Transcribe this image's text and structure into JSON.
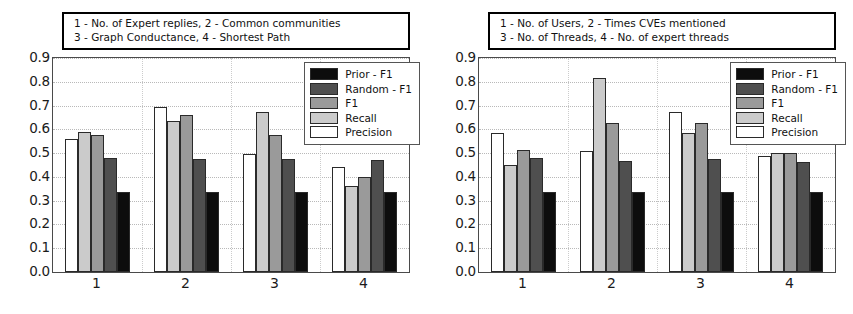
{
  "chart_data": [
    {
      "type": "bar",
      "panel": "left",
      "title": "1 - No. of Expert replies, 2 - Common communities\n3 - Graph Conductance, 4 - Shortest Path",
      "title_lines": [
        "1 - No. of Expert replies, 2 - Common communities",
        "3 - Graph Conductance, 4 - Shortest Path"
      ],
      "categories": [
        "1",
        "2",
        "3",
        "4"
      ],
      "xlabel": "",
      "ylabel": "",
      "ylim": [
        0.0,
        0.9
      ],
      "yticks": [
        "0.0",
        "0.1",
        "0.2",
        "0.3",
        "0.4",
        "0.5",
        "0.6",
        "0.7",
        "0.8",
        "0.9"
      ],
      "grid": true,
      "legend_position": "upper right",
      "series": [
        {
          "name": "Precision",
          "color": "#ffffff",
          "values": [
            0.56,
            0.695,
            0.495,
            0.44
          ]
        },
        {
          "name": "Recall",
          "color": "#cbcbcb",
          "values": [
            0.59,
            0.635,
            0.675,
            0.36
          ]
        },
        {
          "name": "F1",
          "color": "#9a9a9a",
          "values": [
            0.577,
            0.66,
            0.575,
            0.4
          ]
        },
        {
          "name": "Random - F1",
          "color": "#4f4f4f",
          "values": [
            0.48,
            0.475,
            0.475,
            0.47
          ]
        },
        {
          "name": "Prior - F1",
          "color": "#0d0d0d",
          "values": [
            0.335,
            0.335,
            0.335,
            0.335
          ]
        }
      ],
      "legend_order": [
        "Prior - F1",
        "Random - F1",
        "F1",
        "Recall",
        "Precision"
      ]
    },
    {
      "type": "bar",
      "panel": "right",
      "title": "1 - No. of Users, 2 - Times CVEs mentioned\n3 - No. of Threads, 4 - No. of expert threads",
      "title_lines": [
        "1 - No. of Users, 2 - Times CVEs mentioned",
        "3 - No. of Threads, 4 - No. of expert threads"
      ],
      "categories": [
        "1",
        "2",
        "3",
        "4"
      ],
      "xlabel": "",
      "ylabel": "",
      "ylim": [
        0.0,
        0.9
      ],
      "yticks": [
        "0.0",
        "0.1",
        "0.2",
        "0.3",
        "0.4",
        "0.5",
        "0.6",
        "0.7",
        "0.8",
        "0.9"
      ],
      "grid": true,
      "legend_position": "upper right",
      "series": [
        {
          "name": "Precision",
          "color": "#ffffff",
          "values": [
            0.585,
            0.51,
            0.675,
            0.49
          ]
        },
        {
          "name": "Recall",
          "color": "#cbcbcb",
          "values": [
            0.45,
            0.815,
            0.585,
            0.5
          ]
        },
        {
          "name": "F1",
          "color": "#9a9a9a",
          "values": [
            0.512,
            0.625,
            0.625,
            0.5
          ]
        },
        {
          "name": "Random - F1",
          "color": "#4f4f4f",
          "values": [
            0.478,
            0.465,
            0.475,
            0.462
          ]
        },
        {
          "name": "Prior - F1",
          "color": "#0d0d0d",
          "values": [
            0.335,
            0.335,
            0.335,
            0.335
          ]
        }
      ],
      "legend_order": [
        "Prior - F1",
        "Random - F1",
        "F1",
        "Recall",
        "Precision"
      ]
    }
  ]
}
